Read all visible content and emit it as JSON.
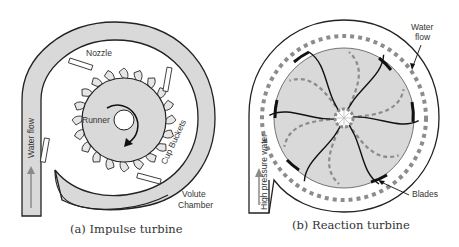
{
  "figure": {
    "panels": [
      {
        "id": "a",
        "caption": "(a) Impulse turbine",
        "labels": {
          "nozzle": "Nozzle",
          "runner": "Runner",
          "cup_buckets": "Cup Buckets",
          "volute_line1": "Volute",
          "volute_line2": "Chamber",
          "water_flow": "Water flow"
        }
      },
      {
        "id": "b",
        "caption": "(b) Reaction turbine",
        "labels": {
          "water_flow_line1": "Water",
          "water_flow_line2": "flow",
          "blades": "Blades",
          "high_pressure_water": "High pressure water"
        }
      }
    ],
    "colors": {
      "casing_fill": "#d9d9d9",
      "outline": "#222222",
      "dash_gray": "#8c8c8c",
      "arrow_gray": "#8a8a8a"
    }
  }
}
